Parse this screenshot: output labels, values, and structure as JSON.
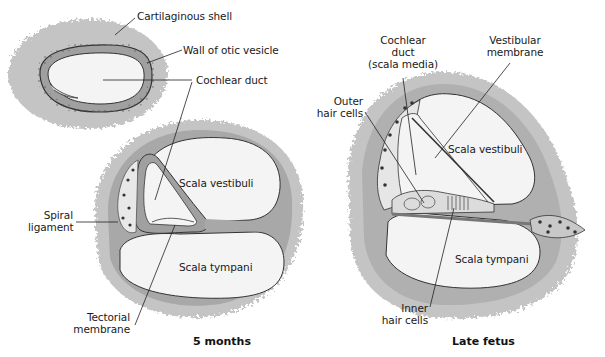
{
  "figure": {
    "panels": [
      {
        "id": "early",
        "caption": ""
      },
      {
        "id": "five-months",
        "caption": "5 months"
      },
      {
        "id": "late-fetus",
        "caption": "Late fetus"
      }
    ]
  },
  "labels": {
    "cartilaginous_shell": "Cartilaginous shell",
    "wall_of_otic_vesicle": "Wall of otic vesicle",
    "cochlear_duct": "Cochlear duct",
    "scala_vestibuli_5m": "Scala vestibuli",
    "scala_tympani_5m": "Scala tympani",
    "spiral_ligament_1": "Spiral",
    "spiral_ligament_2": "ligament",
    "tectorial_membrane_1": "Tectorial",
    "tectorial_membrane_2": "membrane",
    "cochlear_duct_media_1": "Cochlear",
    "cochlear_duct_media_2": "duct",
    "cochlear_duct_media_3": "(scala media)",
    "vestibular_membrane_1": "Vestibular",
    "vestibular_membrane_2": "membrane",
    "outer_hair_cells_1": "Outer",
    "outer_hair_cells_2": "hair cells",
    "scala_vestibuli_lf": "Scala vestibuli",
    "scala_tympani_lf": "Scala tympani",
    "inner_hair_cells_1": "Inner",
    "inner_hair_cells_2": "hair cells"
  },
  "colors": {
    "shell": "#c4c4c4",
    "wall": "#9a9a9a",
    "lumen": "#f4f4f4",
    "outline": "#3a3a3a"
  }
}
